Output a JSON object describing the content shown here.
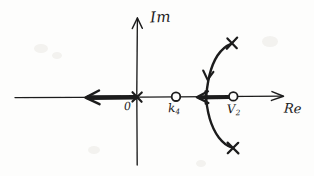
{
  "figure": {
    "kind": "root-locus-sketch",
    "style": "hand-drawn",
    "background_color": "#fdfdfc",
    "ink_color": "#1b1b1b",
    "width": 314,
    "height": 176
  },
  "axes": {
    "imaginary": {
      "label": "Im",
      "orientation": "vertical",
      "arrow": "up",
      "x": 137,
      "y_top": 18,
      "y_bottom": 165
    },
    "real": {
      "label": "Re",
      "orientation": "horizontal",
      "arrow": "right",
      "y": 97,
      "x_left": 15,
      "x_right": 283
    }
  },
  "origin": {
    "label": "0",
    "x": 137,
    "y": 97,
    "marker": "cross"
  },
  "markers": {
    "poles": [
      {
        "name": "pole-origin",
        "label": "0",
        "marker": "cross",
        "x": 137,
        "y": 97
      },
      {
        "name": "pole-upper",
        "label": "",
        "marker": "cross",
        "x": 232,
        "y": 43
      },
      {
        "name": "pole-lower",
        "label": "",
        "marker": "cross",
        "x": 233,
        "y": 148
      }
    ],
    "zeros": [
      {
        "name": "zero-k4",
        "label": "k",
        "subscript": "4",
        "marker": "circle",
        "x": 176,
        "y": 97,
        "radius": 4
      },
      {
        "name": "zero-v2",
        "label": "V",
        "subscript": "2",
        "marker": "circle",
        "x": 233,
        "y": 97,
        "radius": 4
      }
    ]
  },
  "locus": {
    "real_axis_segments": [
      {
        "name": "segment-left-of-origin",
        "from_x": 137,
        "to_x": 85,
        "y": 97,
        "direction": "left",
        "arrow_at_x": 88,
        "thick": true
      },
      {
        "name": "segment-between-zeros",
        "from_x": 233,
        "to_x": 196,
        "y": 97,
        "direction": "left",
        "arrow_at_x": 199,
        "thick": true
      }
    ],
    "branches": [
      {
        "name": "branch-upper",
        "path": "M 206 103 C 207 86 210 66 218 54 C 223 47 228 45 232 43",
        "arrow_at": {
          "x": 211,
          "y": 78,
          "angle_deg": 100
        },
        "terminates_at": "pole-upper"
      },
      {
        "name": "branch-lower",
        "path": "M 206 92 C 207 108 211 126 219 137 C 224 144 229 147 233 148",
        "arrow_at": null,
        "terminates_at": "pole-lower"
      }
    ]
  },
  "labels": {
    "imaginary_axis": "Im",
    "real_axis": "Re",
    "origin": "0",
    "zero_k": "k",
    "zero_k_sub": "4",
    "zero_v": "V",
    "zero_v_sub": "2"
  }
}
